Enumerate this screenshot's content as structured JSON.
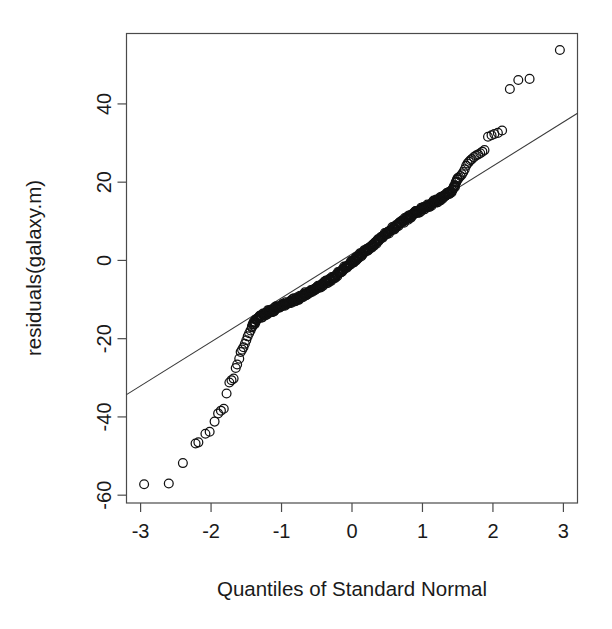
{
  "figure": {
    "background_color": "#ffffff",
    "foreground_color": "#1a1a1a",
    "frame_color": "#4a4a4a",
    "marker_color": "#111111",
    "line_color": "#3a3a3a",
    "width": 612,
    "height": 629
  },
  "chart_data": {
    "type": "scatter",
    "plot_kind": "qq-plot",
    "title": "",
    "xlabel": "Quantiles of Standard Normal",
    "ylabel": "residuals(galaxy.m)",
    "xlim": [
      -3.2,
      3.2
    ],
    "ylim": [
      -62,
      58
    ],
    "grid": false,
    "legend": null,
    "xticks": [
      -3,
      -2,
      -1,
      0,
      1,
      2,
      3
    ],
    "xticklabels": [
      "-3",
      "-2",
      "-1",
      "0",
      "1",
      "2",
      "3"
    ],
    "yticks": [
      -60,
      -40,
      -20,
      0,
      20,
      40
    ],
    "yticklabels": [
      "-60",
      "-40",
      "-20",
      "0",
      "20",
      "40"
    ],
    "reference_line": {
      "description": "robust qqline through first and third quartiles",
      "x": [
        -3.2,
        3.2
      ],
      "y": [
        -34.3,
        37.6
      ],
      "slope": 11.23,
      "intercept": 1.65
    },
    "marker": {
      "shape": "open-circle",
      "radius_px": 4.4,
      "filled": false
    },
    "n_points": 323,
    "points": [
      [
        -2.95,
        -57.2
      ],
      [
        -2.6,
        -57.0
      ],
      [
        -2.4,
        -51.8
      ],
      [
        -2.22,
        -46.8
      ],
      [
        -2.18,
        -46.5
      ],
      [
        -2.08,
        -44.3
      ],
      [
        -2.02,
        -43.8
      ],
      [
        -1.95,
        -41.2
      ],
      [
        -1.9,
        -39.1
      ],
      [
        -1.86,
        -38.4
      ],
      [
        -1.82,
        -37.9
      ],
      [
        -1.78,
        -34.0
      ],
      [
        -1.74,
        -31.2
      ],
      [
        -1.71,
        -30.6
      ],
      [
        -1.68,
        -30.2
      ],
      [
        -1.65,
        -27.5
      ],
      [
        -1.63,
        -26.6
      ],
      [
        -1.6,
        -25.1
      ],
      [
        -1.58,
        -23.4
      ],
      [
        -1.56,
        -22.8
      ],
      [
        -1.54,
        -22.2
      ],
      [
        -1.52,
        -21.3
      ],
      [
        -1.5,
        -20.4
      ],
      [
        -1.48,
        -19.4
      ],
      [
        -1.46,
        -18.6
      ],
      [
        -1.44,
        -17.9
      ],
      [
        -1.42,
        -17.1
      ],
      [
        -1.4,
        -16.3
      ],
      [
        -1.38,
        -15.8
      ],
      [
        -1.36,
        -15.2
      ],
      [
        -1.34,
        -14.9
      ],
      [
        -1.32,
        -14.6
      ],
      [
        -1.3,
        -14.3
      ],
      [
        -1.28,
        -14.1
      ],
      [
        -1.26,
        -13.9
      ],
      [
        -1.24,
        -13.7
      ],
      [
        -1.22,
        -13.5
      ],
      [
        -1.2,
        -13.3
      ],
      [
        -1.18,
        -13.1
      ],
      [
        -1.16,
        -13.0
      ],
      [
        -1.14,
        -12.8
      ],
      [
        -1.12,
        -12.6
      ],
      [
        -1.1,
        -12.5
      ],
      [
        -1.08,
        -12.3
      ],
      [
        -1.06,
        -12.1
      ],
      [
        -1.04,
        -12.0
      ],
      [
        -1.02,
        -11.8
      ],
      [
        -1.0,
        -11.6
      ],
      [
        -0.98,
        -11.5
      ],
      [
        -0.96,
        -11.3
      ],
      [
        -0.94,
        -11.2
      ],
      [
        -0.92,
        -11.0
      ],
      [
        -0.9,
        -10.8
      ],
      [
        -0.88,
        -10.7
      ],
      [
        -0.86,
        -10.5
      ],
      [
        -0.84,
        -10.3
      ],
      [
        -0.82,
        -10.1
      ],
      [
        -0.8,
        -9.9
      ],
      [
        -0.78,
        -9.8
      ],
      [
        -0.76,
        -9.6
      ],
      [
        -0.74,
        -9.4
      ],
      [
        -0.72,
        -9.2
      ],
      [
        -0.7,
        -9.0
      ],
      [
        -0.68,
        -8.8
      ],
      [
        -0.66,
        -8.6
      ],
      [
        -0.64,
        -8.4
      ],
      [
        -0.62,
        -8.2
      ],
      [
        -0.6,
        -8.0
      ],
      [
        -0.58,
        -7.8
      ],
      [
        -0.56,
        -7.6
      ],
      [
        -0.54,
        -7.4
      ],
      [
        -0.52,
        -7.2
      ],
      [
        -0.5,
        -7.0
      ],
      [
        -0.48,
        -6.8
      ],
      [
        -0.46,
        -6.6
      ],
      [
        -0.44,
        -6.4
      ],
      [
        -0.42,
        -6.2
      ],
      [
        -0.4,
        -6.0
      ],
      [
        -0.38,
        -5.7
      ],
      [
        -0.36,
        -5.5
      ],
      [
        -0.34,
        -5.3
      ],
      [
        -0.32,
        -5.0
      ],
      [
        -0.3,
        -4.8
      ],
      [
        -0.28,
        -4.5
      ],
      [
        -0.26,
        -4.2
      ],
      [
        -0.24,
        -4.0
      ],
      [
        -0.22,
        -3.7
      ],
      [
        -0.2,
        -3.4
      ],
      [
        -0.18,
        -3.1
      ],
      [
        -0.16,
        -2.8
      ],
      [
        -0.14,
        -2.5
      ],
      [
        -0.12,
        -2.2
      ],
      [
        -0.1,
        -1.9
      ],
      [
        -0.08,
        -1.6
      ],
      [
        -0.06,
        -1.3
      ],
      [
        -0.04,
        -1.0
      ],
      [
        -0.02,
        -0.7
      ],
      [
        0.0,
        -0.4
      ],
      [
        0.02,
        -0.1
      ],
      [
        0.04,
        0.2
      ],
      [
        0.06,
        0.5
      ],
      [
        0.08,
        0.8
      ],
      [
        0.1,
        1.1
      ],
      [
        0.12,
        1.4
      ],
      [
        0.14,
        1.7
      ],
      [
        0.16,
        2.0
      ],
      [
        0.18,
        2.3
      ],
      [
        0.2,
        2.6
      ],
      [
        0.22,
        2.9
      ],
      [
        0.24,
        3.2
      ],
      [
        0.26,
        3.5
      ],
      [
        0.28,
        3.8
      ],
      [
        0.3,
        4.1
      ],
      [
        0.32,
        4.4
      ],
      [
        0.34,
        4.7
      ],
      [
        0.36,
        5.0
      ],
      [
        0.38,
        5.3
      ],
      [
        0.4,
        5.6
      ],
      [
        0.42,
        5.9
      ],
      [
        0.44,
        6.2
      ],
      [
        0.46,
        6.5
      ],
      [
        0.48,
        6.8
      ],
      [
        0.5,
        7.1
      ],
      [
        0.52,
        7.4
      ],
      [
        0.54,
        7.6
      ],
      [
        0.56,
        7.9
      ],
      [
        0.58,
        8.2
      ],
      [
        0.6,
        8.4
      ],
      [
        0.62,
        8.7
      ],
      [
        0.64,
        9.0
      ],
      [
        0.66,
        9.2
      ],
      [
        0.68,
        9.5
      ],
      [
        0.7,
        9.7
      ],
      [
        0.72,
        10.0
      ],
      [
        0.74,
        10.2
      ],
      [
        0.76,
        10.5
      ],
      [
        0.78,
        10.7
      ],
      [
        0.8,
        11.0
      ],
      [
        0.82,
        11.2
      ],
      [
        0.84,
        11.4
      ],
      [
        0.86,
        11.7
      ],
      [
        0.88,
        11.9
      ],
      [
        0.9,
        12.1
      ],
      [
        0.92,
        12.4
      ],
      [
        0.94,
        12.6
      ],
      [
        0.96,
        12.8
      ],
      [
        0.98,
        13.0
      ],
      [
        1.0,
        13.2
      ],
      [
        1.02,
        13.4
      ],
      [
        1.04,
        13.6
      ],
      [
        1.06,
        13.8
      ],
      [
        1.08,
        14.0
      ],
      [
        1.1,
        14.2
      ],
      [
        1.12,
        14.4
      ],
      [
        1.14,
        14.6
      ],
      [
        1.16,
        14.8
      ],
      [
        1.18,
        15.0
      ],
      [
        1.2,
        15.2
      ],
      [
        1.22,
        15.4
      ],
      [
        1.24,
        15.6
      ],
      [
        1.26,
        15.8
      ],
      [
        1.28,
        16.0
      ],
      [
        1.3,
        16.2
      ],
      [
        1.32,
        16.4
      ],
      [
        1.34,
        16.7
      ],
      [
        1.36,
        16.9
      ],
      [
        1.38,
        17.2
      ],
      [
        1.4,
        17.6
      ],
      [
        1.42,
        18.0
      ],
      [
        1.44,
        18.5
      ],
      [
        1.46,
        19.2
      ],
      [
        1.48,
        20.0
      ],
      [
        1.5,
        20.7
      ],
      [
        1.52,
        21.2
      ],
      [
        1.54,
        21.6
      ],
      [
        1.56,
        22.0
      ],
      [
        1.58,
        22.6
      ],
      [
        1.6,
        23.3
      ],
      [
        1.62,
        24.2
      ],
      [
        1.64,
        24.8
      ],
      [
        1.66,
        25.2
      ],
      [
        1.68,
        25.6
      ],
      [
        1.7,
        25.9
      ],
      [
        1.73,
        26.4
      ],
      [
        1.76,
        26.8
      ],
      [
        1.79,
        27.1
      ],
      [
        1.82,
        27.4
      ],
      [
        1.85,
        27.8
      ],
      [
        1.88,
        28.2
      ],
      [
        1.93,
        31.6
      ],
      [
        1.98,
        32.0
      ],
      [
        2.02,
        32.3
      ],
      [
        2.07,
        32.6
      ],
      [
        2.13,
        33.2
      ],
      [
        2.24,
        43.8
      ],
      [
        2.36,
        46.1
      ],
      [
        2.52,
        46.4
      ],
      [
        2.95,
        53.8
      ]
    ],
    "dense_band": {
      "description": "central mass of ~320 residuals forming a near-solid black band along the line between x=-1.4 and x=1.5",
      "x_start": -1.42,
      "x_end": 1.5,
      "y_start": -17.0,
      "y_end": 20.5,
      "n_overplotted": 300
    },
    "annotations": []
  },
  "axes": {
    "x_title": "Quantiles of Standard Normal",
    "y_title": "residuals(galaxy.m)"
  }
}
